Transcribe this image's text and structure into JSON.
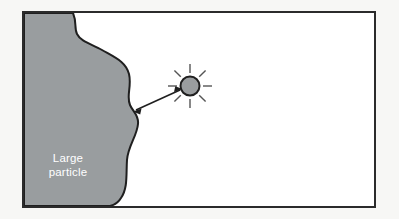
{
  "figure": {
    "type": "scientific-diagram",
    "caption_text": "",
    "frame": {
      "border_color": "#2b2b2b",
      "border_width": 2,
      "fill_color": "#ffffff",
      "outer_background": "#f7f7f5",
      "x": 22,
      "y": 11,
      "width": 354,
      "height": 197
    },
    "large_particle": {
      "label_line1": "Large",
      "label_line2": "particle",
      "label_color": "#ffffff",
      "fill_color": "#999d9f",
      "outline_color": "#1f1f1f",
      "outline_width": 2,
      "label_x": 68,
      "label_y1": 158,
      "label_y2": 172
    },
    "small_particle": {
      "name": "small-particle",
      "fill_color": "#9a9d9f",
      "outline_color": "#1f1f1f",
      "outline_width": 2,
      "center_x": 190,
      "center_y": 86,
      "radius": 9.5,
      "ray_count": 8,
      "ray_color": "#555555",
      "ray_inner_radius": 13,
      "ray_outer_radius": 22,
      "ray_width": 1.4
    },
    "arrow": {
      "name": "double-headed-arrow",
      "color": "#1f1f1f",
      "width": 1.6,
      "double_headed": true,
      "from_x": 134,
      "from_y": 111,
      "to_x": 181,
      "to_y": 90
    }
  }
}
